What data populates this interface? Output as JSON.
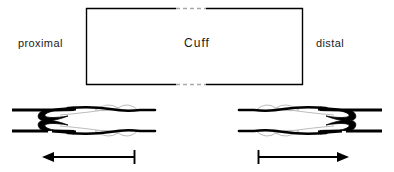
{
  "figure": {
    "background_color": "#ffffff",
    "stroke_color": "#000000",
    "faint_stroke_color": "#b9b9b9",
    "text_color": "#1a1a1a",
    "width": 394,
    "height": 172
  },
  "labels": {
    "proximal": "proximal",
    "distal": "distal",
    "cuff": "Cuff"
  },
  "cuff_box": {
    "x": 86,
    "y": 8,
    "width": 217,
    "height": 77,
    "top_gap": {
      "start": 176,
      "end": 206,
      "style": "dashed"
    },
    "bottom_gap": {
      "start": 176,
      "end": 206,
      "style": "dashed"
    }
  },
  "vessels": [
    {
      "name": "proximal-vessel",
      "side": "left",
      "x_start": 12,
      "x_end": 155,
      "upper_wall_y": 110,
      "lower_wall_y": 131,
      "valve_orientation": "opens-proximally"
    },
    {
      "name": "distal-vessel",
      "side": "right",
      "x_start": 229,
      "x_end": 382,
      "upper_wall_y": 110,
      "lower_wall_y": 131,
      "valve_orientation": "opens-distally"
    }
  ],
  "arrows": [
    {
      "name": "proximal-flow-arrow",
      "direction": "left",
      "x_head": 43,
      "x_tail": 135,
      "y": 157,
      "tail_cap": "tick"
    },
    {
      "name": "distal-flow-arrow",
      "direction": "right",
      "x_head": 348,
      "x_tail": 258,
      "y": 157,
      "tail_cap": "tick"
    }
  ]
}
